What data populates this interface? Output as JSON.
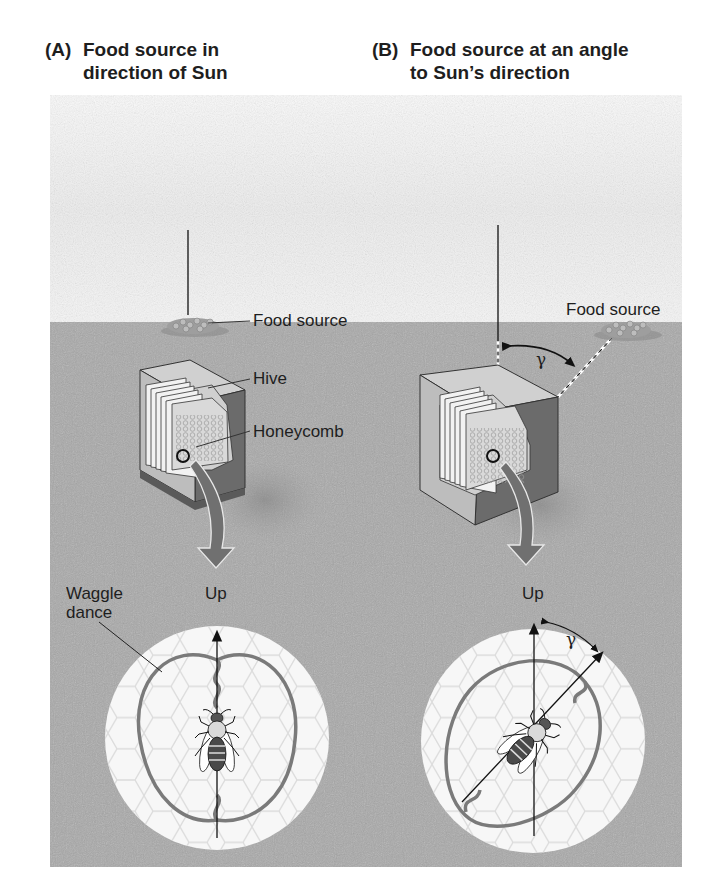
{
  "panels": [
    {
      "tag": "(A)",
      "title_line1": "Food source in",
      "title_line2": "direction of Sun",
      "labels": {
        "food_source": "Food source",
        "hive": "Hive",
        "honeycomb": "Honeycomb",
        "waggle_line1": "Waggle",
        "waggle_line2": "dance",
        "up": "Up"
      }
    },
    {
      "tag": "(B)",
      "title_line1": "Food source at an angle",
      "title_line2": "to Sun’s direction",
      "labels": {
        "food_source": "Food source",
        "gamma_ground": "γ",
        "gamma_dance": "γ",
        "up": "Up"
      }
    }
  ],
  "colors": {
    "ground": "#a9a9a9",
    "sky": "#f4f4f4",
    "hive_top": "#d4d4d4",
    "hive_side": "#6e6e6e",
    "comb_disc": "#f7f7f7",
    "waggle_path": "#7a7a7a",
    "arrow": "#707070"
  }
}
